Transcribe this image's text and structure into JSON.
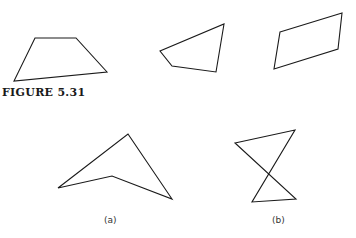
{
  "figure": {
    "title": "FIGURE 5.31",
    "stroke_color": "#1a1a1a",
    "background": "#ffffff"
  },
  "top_row": {
    "shapes": [
      {
        "name": "quadrilateral-1",
        "points": "35,38 76,38 107,72 14,81"
      },
      {
        "name": "quadrilateral-2",
        "points": "224,24 216,72 172,66 160,51"
      },
      {
        "name": "quadrilateral-3",
        "points": "280,32 342,13 338,49 274,69"
      }
    ]
  },
  "bottom_row": {
    "items": [
      {
        "label": "(a)",
        "name": "concave-quadrilateral",
        "points": "128,134 172,199 112,176 58,188",
        "label_x": 104
      },
      {
        "label": "(b)",
        "name": "self-intersecting-quadrilateral",
        "points": "235,143 295,130 252,202 296,199",
        "label_x": 272
      }
    ]
  }
}
